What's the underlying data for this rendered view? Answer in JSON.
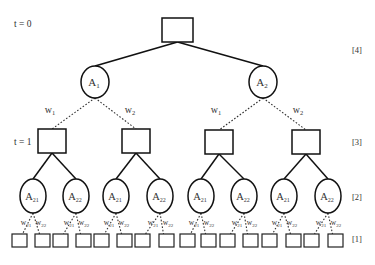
{
  "diagram": {
    "type": "tree",
    "time_labels": [
      {
        "text": "t = 0",
        "x": 14,
        "y": 27
      },
      {
        "text": "t = 1",
        "x": 14,
        "y": 145
      }
    ],
    "level_labels": [
      {
        "text": "[4]",
        "x": 352,
        "y": 53
      },
      {
        "text": "[3]",
        "x": 352,
        "y": 145
      },
      {
        "text": "[2]",
        "x": 352,
        "y": 200
      },
      {
        "text": "[1]",
        "x": 352,
        "y": 242
      }
    ],
    "root": {
      "x": 162,
      "y": 18,
      "w": 31,
      "h": 24
    },
    "level4_actions": [
      {
        "label": "A",
        "sub": "1",
        "cx": 95,
        "cy": 82,
        "rx": 14,
        "ry": 16
      },
      {
        "label": "A",
        "sub": "2",
        "cx": 263,
        "cy": 82,
        "rx": 14,
        "ry": 16
      }
    ],
    "level4_weights": [
      {
        "label": "w",
        "sub": "1",
        "x": 50,
        "y": 113
      },
      {
        "label": "w",
        "sub": "2",
        "x": 130,
        "y": 113
      },
      {
        "label": "w",
        "sub": "1",
        "x": 216,
        "y": 113
      },
      {
        "label": "w",
        "sub": "2",
        "x": 298,
        "y": 113
      }
    ],
    "level3_nodes": [
      {
        "x": 38,
        "y": 129,
        "w": 28,
        "h": 24
      },
      {
        "x": 122,
        "y": 129,
        "w": 28,
        "h": 24
      },
      {
        "x": 205,
        "y": 130,
        "w": 28,
        "h": 24
      },
      {
        "x": 292,
        "y": 130,
        "w": 28,
        "h": 24
      }
    ],
    "level2_actions": [
      {
        "label": "A",
        "sub": "21",
        "cx": 33,
        "cy": 196
      },
      {
        "label": "A",
        "sub": "22",
        "cx": 76,
        "cy": 196
      },
      {
        "label": "A",
        "sub": "21",
        "cx": 116,
        "cy": 196
      },
      {
        "label": "A",
        "sub": "22",
        "cx": 160,
        "cy": 196
      },
      {
        "label": "A",
        "sub": "21",
        "cx": 201,
        "cy": 196
      },
      {
        "label": "A",
        "sub": "22",
        "cx": 244,
        "cy": 196
      },
      {
        "label": "A",
        "sub": "21",
        "cx": 284,
        "cy": 196
      },
      {
        "label": "A",
        "sub": "22",
        "cx": 328,
        "cy": 196
      }
    ],
    "level2_weight_labels": {
      "left": "w",
      "left_sub": "21",
      "right": "w",
      "right_sub": "22"
    },
    "leaves_x": [
      12,
      35,
      53,
      76,
      94,
      117,
      135,
      159,
      180,
      201,
      220,
      243,
      262,
      286,
      304,
      328
    ],
    "leaf_y": 234,
    "leaf_w": 15,
    "leaf_h": 13
  }
}
